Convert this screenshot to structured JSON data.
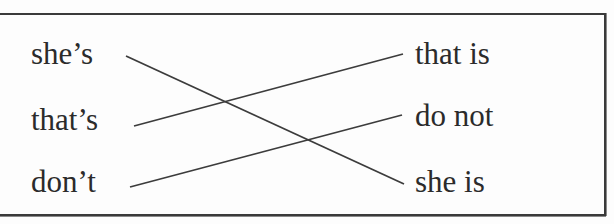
{
  "exercise": {
    "left_column": [
      {
        "label": "she’s"
      },
      {
        "label": "that’s"
      },
      {
        "label": "don’t"
      }
    ],
    "right_column": [
      {
        "label": "that is"
      },
      {
        "label": "do not"
      },
      {
        "label": "she is"
      }
    ],
    "matches": [
      {
        "from": "she’s",
        "to": "she is",
        "x1": 126,
        "y1": 56,
        "x2": 404,
        "y2": 184
      },
      {
        "from": "that’s",
        "to": "that is",
        "x1": 134,
        "y1": 126,
        "x2": 403,
        "y2": 54
      },
      {
        "from": "don’t",
        "to": "do not",
        "x1": 130,
        "y1": 187,
        "x2": 402,
        "y2": 115
      }
    ],
    "colors": {
      "text": "#2b2b2b",
      "line": "#3c3c3c",
      "border": "#3a3a3a",
      "background": "#fdfdfd"
    }
  }
}
